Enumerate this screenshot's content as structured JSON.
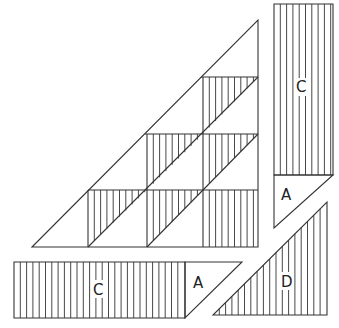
{
  "diagram": {
    "stroke_color": "#333333",
    "background": "#ffffff",
    "hatch_spacing": 6.3,
    "main_triangle": {
      "grid_x": [
        32,
        88,
        147,
        203,
        258
      ],
      "grid_y": [
        20,
        77,
        134,
        190,
        247
      ],
      "shaded_cells": [
        {
          "row": 1,
          "col": 3,
          "fill": "upper-left-half"
        },
        {
          "row": 2,
          "col": 2,
          "fill": "upper-left-half"
        },
        {
          "row": 2,
          "col": 3,
          "fill": "upper-left-half"
        },
        {
          "row": 3,
          "col": 1,
          "fill": "upper-left-half"
        },
        {
          "row": 3,
          "col": 2,
          "fill": "upper-left-half"
        },
        {
          "row": 3,
          "col": 3,
          "fill": "full"
        }
      ]
    },
    "pieces": [
      {
        "id": "right-strip",
        "label_strip": "C",
        "label_tip": "A"
      },
      {
        "id": "bottom-strip",
        "label_strip": "C",
        "label_tip": "A"
      },
      {
        "id": "corner-triangle",
        "label": "D"
      }
    ]
  },
  "labels": {
    "right_c": "C",
    "right_a": "A",
    "bottom_c": "C",
    "bottom_a": "A",
    "corner_d": "D"
  }
}
